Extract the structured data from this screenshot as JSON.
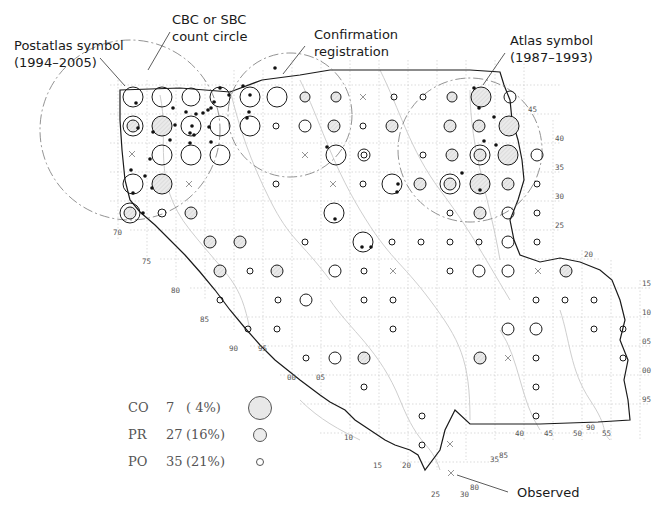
{
  "figure": {
    "type": "breeding-bird distribution map",
    "callouts": [
      {
        "id": "postatlas",
        "line1": "Postatlas symbol",
        "line2": "(1994–2005)"
      },
      {
        "id": "cbc",
        "line1": "CBC or SBC",
        "line2": "count circle"
      },
      {
        "id": "confirmation",
        "line1": "Confirmation",
        "line2": "registration"
      },
      {
        "id": "atlas",
        "line1": "Atlas symbol",
        "line2": "(1987–1993)"
      },
      {
        "id": "observed",
        "line1": "Observed"
      }
    ],
    "legend": [
      {
        "code": "CO",
        "count": "7",
        "pct": "( 4%)",
        "symbol": "large-shaded-circle",
        "meaning": "Confirmed"
      },
      {
        "code": "PR",
        "count": "27",
        "pct": "(16%)",
        "symbol": "medium-shaded-circle",
        "meaning": "Probable"
      },
      {
        "code": "PO",
        "count": "35",
        "pct": "(21%)",
        "symbol": "small-open-circle",
        "meaning": "Possible"
      }
    ],
    "grid_labels": {
      "left_diagonal": [
        "70",
        "75",
        "80",
        "85",
        "90",
        "95",
        "00",
        "05",
        "10",
        "15",
        "20",
        "25",
        "30"
      ],
      "right_column": [
        "45",
        "40",
        "35",
        "30",
        "25",
        "20",
        "15",
        "10",
        "05",
        "00",
        "95"
      ],
      "bottom_row": [
        "40",
        "45",
        "50",
        "55"
      ],
      "extra": [
        "90",
        "35",
        "85",
        "80"
      ]
    },
    "colors": {
      "outline": "#1a1a1a",
      "grid": "#b0b0b0",
      "rivers": "#c8c8c8",
      "fill_shaded": "#e4e4e4",
      "text": "#1a1a1a",
      "legend_text": "#555555"
    }
  }
}
